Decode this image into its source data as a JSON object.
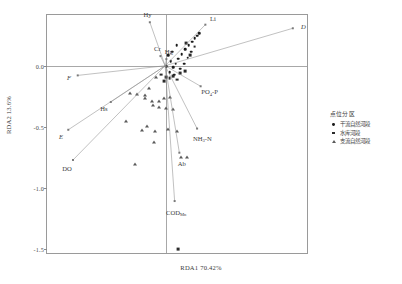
{
  "chart_data": {
    "type": "scatter",
    "title": "",
    "xlabel": "RDA1 70.42%",
    "ylabel": "RDA2 13.6%",
    "xlim": [
      -1.0,
      1.2
    ],
    "ylim": [
      -1.55,
      0.42
    ],
    "grid": false,
    "legend_position": "right",
    "xticks": [],
    "yticks": [
      "0.0",
      "-0.5",
      "-1.0",
      "-1.5"
    ],
    "ytick_values": [
      0.0,
      -0.5,
      -1.0,
      -1.5
    ],
    "vectors": [
      {
        "label": "D",
        "x": 1.08,
        "y": 0.31,
        "italic": true
      },
      {
        "label": "Li",
        "x": 0.34,
        "y": 0.34,
        "italic": false
      },
      {
        "label": "Hy",
        "x": -0.13,
        "y": 0.36,
        "italic": false
      },
      {
        "label": "Cr",
        "x": -0.04,
        "y": 0.08,
        "italic": false
      },
      {
        "label": "Hg",
        "x": 0.01,
        "y": 0.055,
        "italic": false
      },
      {
        "label": "F",
        "x": -0.74,
        "y": -0.08,
        "italic": true
      },
      {
        "label": "Hs",
        "x": -0.46,
        "y": -0.3,
        "italic": false
      },
      {
        "label": "E",
        "x": -0.82,
        "y": -0.53,
        "italic": true
      },
      {
        "label": "DO",
        "x": -0.78,
        "y": -0.78,
        "italic": false
      },
      {
        "label": "PO4-P",
        "x": 0.3,
        "y": -0.17,
        "italic": false
      },
      {
        "label": "NH3-N",
        "x": 0.27,
        "y": -0.52,
        "italic": false
      },
      {
        "label": "Ab",
        "x": 0.12,
        "y": -0.72,
        "italic": false
      },
      {
        "label": "CODMn",
        "x": 0.08,
        "y": -1.12,
        "italic": false
      }
    ],
    "series": [
      {
        "name": "干流自然河段",
        "marker": "circle",
        "points": [
          {
            "x": 0.1,
            "y": 0.06
          },
          {
            "x": 0.13,
            "y": 0.1
          },
          {
            "x": 0.16,
            "y": 0.14
          },
          {
            "x": 0.19,
            "y": 0.17
          },
          {
            "x": 0.22,
            "y": 0.2
          },
          {
            "x": 0.24,
            "y": 0.23
          },
          {
            "x": 0.26,
            "y": 0.25
          },
          {
            "x": 0.08,
            "y": 0.02
          },
          {
            "x": 0.06,
            "y": -0.01
          },
          {
            "x": 0.04,
            "y": 0.04
          },
          {
            "x": 0.12,
            "y": -0.02
          },
          {
            "x": 0.15,
            "y": 0.02
          },
          {
            "x": 0.02,
            "y": 0.09
          },
          {
            "x": 0.18,
            "y": 0.07
          },
          {
            "x": 0.21,
            "y": 0.12
          },
          {
            "x": 0.05,
            "y": 0.12
          },
          {
            "x": 0.09,
            "y": 0.17
          },
          {
            "x": 0.28,
            "y": 0.27
          },
          {
            "x": 0.0,
            "y": 0.0
          },
          {
            "x": 0.03,
            "y": -0.05
          },
          {
            "x": 0.07,
            "y": -0.07
          }
        ]
      },
      {
        "name": "水库河段",
        "marker": "square",
        "points": [
          {
            "x": 0.0,
            "y": -0.09
          },
          {
            "x": 0.03,
            "y": -0.1
          },
          {
            "x": 0.06,
            "y": -0.08
          },
          {
            "x": -0.02,
            "y": -0.12
          },
          {
            "x": 0.09,
            "y": -0.11
          },
          {
            "x": 0.12,
            "y": -0.06
          },
          {
            "x": 0.16,
            "y": -0.04
          },
          {
            "x": 0.2,
            "y": 0.09
          },
          {
            "x": 0.24,
            "y": 0.16
          },
          {
            "x": 0.1,
            "y": -1.5
          },
          {
            "x": -0.04,
            "y": -0.07
          },
          {
            "x": 0.17,
            "y": 0.19
          }
        ]
      },
      {
        "name": "支流自然河段",
        "marker": "triangle",
        "points": [
          {
            "x": -0.3,
            "y": -0.22
          },
          {
            "x": -0.24,
            "y": -0.2
          },
          {
            "x": -0.18,
            "y": -0.19
          },
          {
            "x": -0.12,
            "y": -0.21
          },
          {
            "x": -0.06,
            "y": -0.24
          },
          {
            "x": 0.0,
            "y": -0.22
          },
          {
            "x": 0.06,
            "y": -0.2
          },
          {
            "x": -0.34,
            "y": -0.28
          },
          {
            "x": -0.2,
            "y": -0.33
          },
          {
            "x": -0.1,
            "y": -0.4
          },
          {
            "x": 0.02,
            "y": -0.27
          },
          {
            "x": 0.09,
            "y": -0.26
          },
          {
            "x": -0.08,
            "y": 0.21
          },
          {
            "x": -0.14,
            "y": 0.14
          },
          {
            "x": -0.18,
            "y": 0.08
          },
          {
            "x": -0.11,
            "y": 0.05
          },
          {
            "x": -0.06,
            "y": 0.11
          },
          {
            "x": -0.02,
            "y": 0.16
          },
          {
            "x": 0.03,
            "y": 0.19
          },
          {
            "x": -0.16,
            "y": -0.02
          },
          {
            "x": -0.09,
            "y": -0.04
          },
          {
            "x": 0.13,
            "y": -0.23
          },
          {
            "x": -0.26,
            "y": -0.26
          },
          {
            "x": 0.18,
            "y": -0.18
          }
        ]
      }
    ]
  },
  "legend": {
    "title": "点位分区",
    "items": [
      {
        "label": "干流自然河段",
        "marker": "circle"
      },
      {
        "label": "水库河段",
        "marker": "square"
      },
      {
        "label": "支流自然河段",
        "marker": "triangle"
      }
    ]
  },
  "caption": ""
}
